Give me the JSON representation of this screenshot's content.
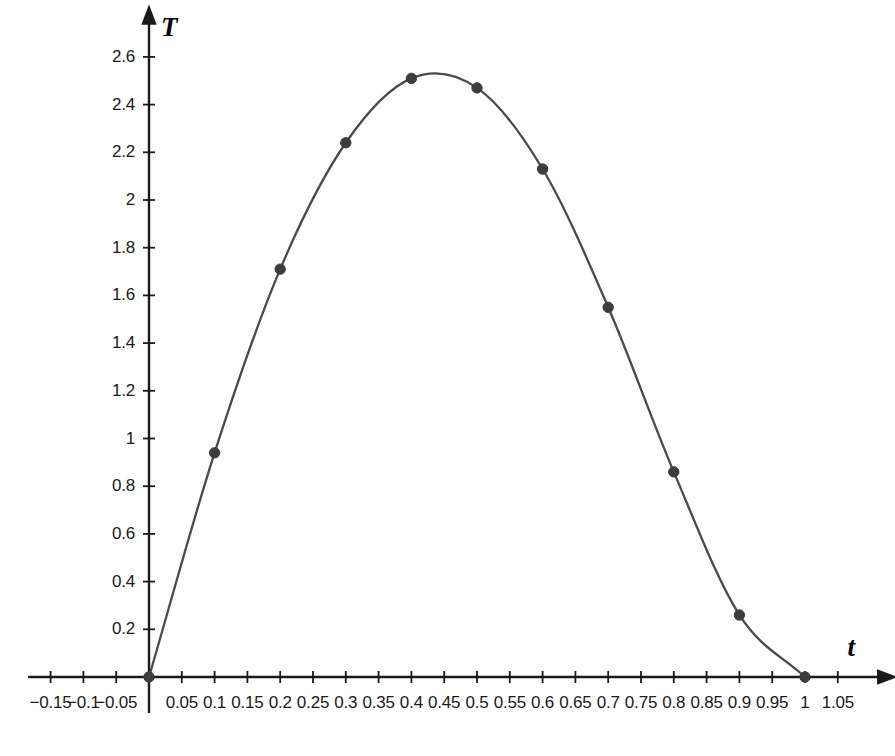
{
  "chart_data": {
    "type": "line",
    "title": "",
    "subtitle": "",
    "xlabel": "t",
    "ylabel": "T",
    "xlim": [
      -0.175,
      1.08
    ],
    "ylim": [
      -0.07,
      2.72
    ],
    "grid": false,
    "legend": null,
    "x_ticks": [
      -0.15,
      -0.1,
      -0.05,
      0.05,
      0.1,
      0.15,
      0.2,
      0.25,
      0.3,
      0.35,
      0.4,
      0.45,
      0.5,
      0.55,
      0.6,
      0.65,
      0.7,
      0.75,
      0.8,
      0.85,
      0.9,
      0.95,
      1,
      1.05
    ],
    "x_tick_labels": [
      "−0.15",
      "−0.1",
      "−0.05",
      "0.05",
      "0.1",
      "0.15",
      "0.2",
      "0.25",
      "0.3",
      "0.35",
      "0.4",
      "0.45",
      "0.5",
      "0.55",
      "0.6",
      "0.65",
      "0.7",
      "0.75",
      "0.8",
      "0.85",
      "0.9",
      "0.95",
      "1",
      "1.05"
    ],
    "y_ticks": [
      0.2,
      0.4,
      0.6,
      0.8,
      1,
      1.2,
      1.4,
      1.6,
      1.8,
      2,
      2.2,
      2.4,
      2.6
    ],
    "y_tick_labels": [
      "0.2",
      "0.4",
      "0.6",
      "0.8",
      "1",
      "1.2",
      "1.4",
      "1.6",
      "1.8",
      "2",
      "2.2",
      "2.4",
      "2.6"
    ],
    "series": [
      {
        "name": "T(t)",
        "marker": "circle",
        "color": "#4a4a4a",
        "line_color": "#4a4a4a",
        "x": [
          0,
          0.1,
          0.2,
          0.3,
          0.4,
          0.5,
          0.6,
          0.7,
          0.8,
          0.9,
          1
        ],
        "values": [
          0,
          0.94,
          1.71,
          2.24,
          2.51,
          2.47,
          2.13,
          1.55,
          0.86,
          0.26,
          0
        ]
      }
    ],
    "curve_peak": {
      "t": 0.43,
      "T": 2.54
    },
    "annotations": []
  },
  "axes": {
    "x_axis_arrow": "arrow-right",
    "y_axis_arrow": "arrow-up",
    "x_label": "t",
    "y_label": "T"
  },
  "colors": {
    "axis": "#1a1a1a",
    "curve": "#4a4a4a",
    "marker": "#3d3d3d",
    "text": "#1a1a1a",
    "background": "#ffffff"
  }
}
